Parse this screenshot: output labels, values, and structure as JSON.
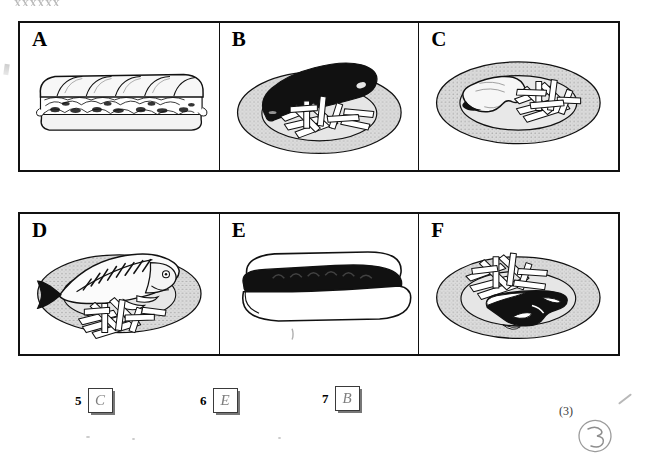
{
  "document": {
    "type": "exam-worksheet",
    "top_cropped_text": "XXXXXX",
    "marks_label": "(3)",
    "handwritten_score": "3"
  },
  "grid": {
    "rows": [
      {
        "cells": [
          {
            "label": "A",
            "item": "baguette-sandwich",
            "icon": "sandwich-icon"
          },
          {
            "label": "B",
            "item": "sausage-and-chips",
            "icon": "sausage-plate-icon"
          },
          {
            "label": "C",
            "item": "chicken-and-chips",
            "icon": "chicken-plate-icon"
          }
        ]
      },
      {
        "cells": [
          {
            "label": "D",
            "item": "fish-and-chips",
            "icon": "fish-plate-icon"
          },
          {
            "label": "E",
            "item": "hot-dog",
            "icon": "hotdog-icon"
          },
          {
            "label": "F",
            "item": "steak-and-chips",
            "icon": "steak-plate-icon"
          }
        ]
      }
    ]
  },
  "answers": {
    "items": [
      {
        "number": "5",
        "letter": "C"
      },
      {
        "number": "6",
        "letter": "E"
      },
      {
        "number": "7",
        "letter": "B"
      }
    ]
  },
  "colors": {
    "ink": "#111111",
    "plate_fill": "#d6d6d6",
    "plate_rim": "#bdbdbd",
    "pencil": "#777777",
    "paper": "#ffffff"
  }
}
